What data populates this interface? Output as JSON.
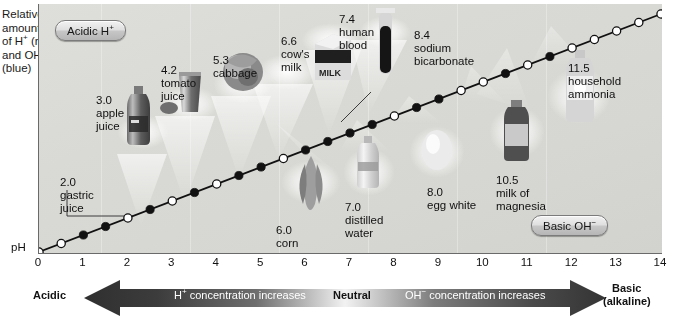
{
  "figure": {
    "y_caption_lines": [
      "Relative",
      "amounts",
      "of H+ (red)",
      "and OH−",
      "(blue)"
    ],
    "ph_axis_label": "pH",
    "acidic_pill": "Acidic H+",
    "basic_pill": "Basic OH−",
    "bottom_caption": ""
  },
  "axis": {
    "ticks": [
      "0",
      "1",
      "2",
      "3",
      "4",
      "5",
      "6",
      "7",
      "8",
      "9",
      "10",
      "11",
      "12",
      "13",
      "14"
    ],
    "min": 0,
    "max": 14
  },
  "arrow_bar": {
    "left_label": "Acidic",
    "left_text": "H+ concentration increases",
    "center_label": "Neutral",
    "right_text": "OH− concentration increases",
    "right_label_line1": "Basic",
    "right_label_line2": "(alkaline)",
    "acid_color": "#3a3a3a",
    "neutral_color": "#f4f4f4",
    "base_color": "#3a3a3a"
  },
  "chart_data": {
    "type": "line",
    "xlabel": "pH",
    "ylabel": "Relative amounts of H+ (red) and OH- (blue)",
    "xlim": [
      0,
      14
    ],
    "ylim": [
      0,
      1
    ],
    "grid": false,
    "legend": "none",
    "x": [
      0,
      0.5,
      1,
      1.5,
      2,
      2.5,
      3,
      3.5,
      4,
      4.5,
      5,
      5.5,
      6,
      6.5,
      7,
      7.5,
      8,
      8.5,
      9,
      9.5,
      10,
      10.5,
      11,
      11.5,
      12,
      12.5,
      13,
      13.5,
      14
    ],
    "y": [
      0,
      0.0357,
      0.0714,
      0.1071,
      0.1429,
      0.1786,
      0.2143,
      0.25,
      0.2857,
      0.3214,
      0.3571,
      0.3929,
      0.4286,
      0.4643,
      0.5,
      0.5357,
      0.5714,
      0.6071,
      0.6429,
      0.6786,
      0.7143,
      0.75,
      0.7857,
      0.8214,
      0.8571,
      0.8929,
      0.9286,
      0.9643,
      1.0
    ],
    "marker_styles": [
      "open",
      "open",
      "filled",
      "filled",
      "open",
      "filled",
      "open",
      "filled",
      "open",
      "filled",
      "filled",
      "open",
      "filled",
      "filled",
      "filled",
      "filled",
      "open",
      "filled",
      "filled",
      "open",
      "open",
      "filled",
      "open",
      "filled",
      "open",
      "open",
      "open",
      "open",
      "open"
    ],
    "annotations": [
      {
        "ph": "2.0",
        "name": "gastric juice",
        "label": "2.0\ngastric\njuice"
      },
      {
        "ph": "3.0",
        "name": "apple juice",
        "label": "3.0\napple\njuice"
      },
      {
        "ph": "4.2",
        "name": "tomato juice",
        "label": "4.2\ntomato\njuice"
      },
      {
        "ph": "5.3",
        "name": "cabbage",
        "label": "5.3\ncabbage"
      },
      {
        "ph": "6.0",
        "name": "corn",
        "label": "6.0\ncorn"
      },
      {
        "ph": "6.6",
        "name": "cow's milk",
        "label": "6.6\ncow's\nmilk"
      },
      {
        "ph": "7.0",
        "name": "distilled water",
        "label": "7.0\ndistilled\nwater"
      },
      {
        "ph": "7.4",
        "name": "human blood",
        "label": "7.4\nhuman\nblood"
      },
      {
        "ph": "8.0",
        "name": "egg white",
        "label": "8.0\negg white"
      },
      {
        "ph": "8.4",
        "name": "sodium bicarbonate",
        "label": "8.4\nsodium\nbicarbonate"
      },
      {
        "ph": "10.5",
        "name": "milk of magnesia",
        "label": "10.5\nmilk of\nmagnesia"
      },
      {
        "ph": "11.5",
        "name": "household ammonia",
        "label": "11.5\nhousehold\nammonia"
      }
    ]
  },
  "items": [
    {
      "id": "gastric-juice",
      "l1": "2.0",
      "l2": "gastric",
      "l3": "juice"
    },
    {
      "id": "apple-juice",
      "l1": "3.0",
      "l2": "apple",
      "l3": "juice"
    },
    {
      "id": "tomato-juice",
      "l1": "4.2",
      "l2": "tomato",
      "l3": "juice"
    },
    {
      "id": "cabbage",
      "l1": "5.3",
      "l2": "cabbage",
      "l3": ""
    },
    {
      "id": "corn",
      "l1": "6.0",
      "l2": "corn",
      "l3": ""
    },
    {
      "id": "cows-milk",
      "l1": "6.6",
      "l2": "cow's",
      "l3": "milk"
    },
    {
      "id": "distilled-water",
      "l1": "7.0",
      "l2": "distilled",
      "l3": "water"
    },
    {
      "id": "human-blood",
      "l1": "7.4",
      "l2": "human",
      "l3": "blood"
    },
    {
      "id": "egg-white",
      "l1": "8.0",
      "l2": "egg white",
      "l3": ""
    },
    {
      "id": "sodium-bicarbonate",
      "l1": "8.4",
      "l2": "sodium",
      "l3": "bicarbonate"
    },
    {
      "id": "milk-of-magnesia",
      "l1": "10.5",
      "l2": "milk of",
      "l3": "magnesia"
    },
    {
      "id": "household-ammonia",
      "l1": "11.5",
      "l2": "household",
      "l3": "ammonia"
    }
  ]
}
